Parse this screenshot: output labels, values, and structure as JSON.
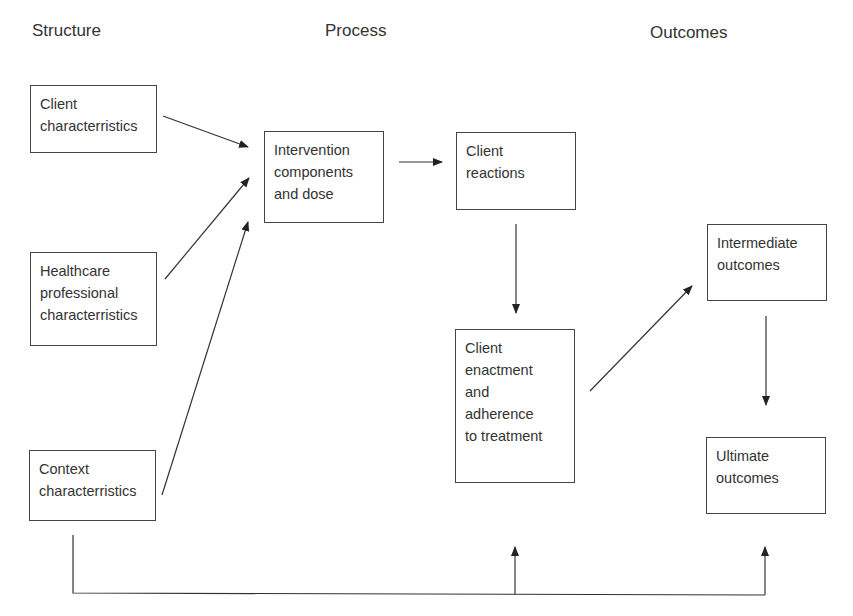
{
  "headings": {
    "structure": "Structure",
    "process": "Process",
    "outcomes": "Outcomes"
  },
  "nodes": {
    "client_characteristics": "Client\ncharacterristics",
    "healthcare_professional": "Healthcare\nprofessional\ncharacterristics",
    "context_characteristics": "Context\ncharacterristics",
    "intervention": "Intervention\ncomponents\nand dose",
    "client_reactions": "Client\nreactions",
    "client_enactment": "Client\nenactment\nand\nadherence\nto treatment",
    "intermediate_outcomes": "Intermediate\noutcomes",
    "ultimate_outcomes": "Ultimate\noutcomes"
  },
  "edges": [
    {
      "from": "client_characteristics",
      "to": "intervention"
    },
    {
      "from": "healthcare_professional",
      "to": "intervention"
    },
    {
      "from": "context_characteristics",
      "to": "intervention"
    },
    {
      "from": "intervention",
      "to": "client_reactions"
    },
    {
      "from": "client_reactions",
      "to": "client_enactment"
    },
    {
      "from": "client_enactment",
      "to": "intermediate_outcomes"
    },
    {
      "from": "intermediate_outcomes",
      "to": "ultimate_outcomes"
    },
    {
      "from": "context_characteristics",
      "to": "client_enactment"
    },
    {
      "from": "context_characteristics",
      "to": "ultimate_outcomes"
    }
  ],
  "colors": {
    "line": "#333333",
    "text": "#333333",
    "background": "#ffffff"
  }
}
